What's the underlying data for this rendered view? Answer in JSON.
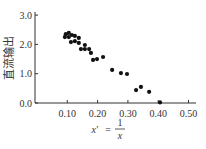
{
  "chart_data": {
    "type": "scatter",
    "title": "",
    "xlabel": "x' = 1/x",
    "xlabel_parts": {
      "lhs": "x'",
      "eq": "=",
      "num": "1",
      "den": "x"
    },
    "ylabel": "直流输出",
    "xlim": [
      0.0,
      0.52
    ],
    "ylim": [
      0.0,
      3.1
    ],
    "x_ticks": [
      "0.10",
      "0.20",
      "0.30",
      "0.40",
      "0.50"
    ],
    "y_ticks": [
      "0.0",
      "1.0",
      "2.0",
      "3.0"
    ],
    "grid": false,
    "legend": null,
    "series": [
      {
        "name": "data",
        "points": [
          [
            0.095,
            2.35
          ],
          [
            0.105,
            2.39
          ],
          [
            0.115,
            2.32
          ],
          [
            0.092,
            2.25
          ],
          [
            0.105,
            2.25
          ],
          [
            0.125,
            2.29
          ],
          [
            0.138,
            2.22
          ],
          [
            0.112,
            2.08
          ],
          [
            0.125,
            2.11
          ],
          [
            0.138,
            2.05
          ],
          [
            0.158,
            1.98
          ],
          [
            0.172,
            1.84
          ],
          [
            0.145,
            1.84
          ],
          [
            0.158,
            1.84
          ],
          [
            0.178,
            1.71
          ],
          [
            0.185,
            1.47
          ],
          [
            0.198,
            1.5
          ],
          [
            0.218,
            1.57
          ],
          [
            0.248,
            1.13
          ],
          [
            0.277,
            1.02
          ],
          [
            0.297,
            0.99
          ],
          [
            0.327,
            0.44
          ],
          [
            0.343,
            0.55
          ],
          [
            0.37,
            0.38
          ],
          [
            0.406,
            0.02
          ]
        ]
      }
    ]
  }
}
